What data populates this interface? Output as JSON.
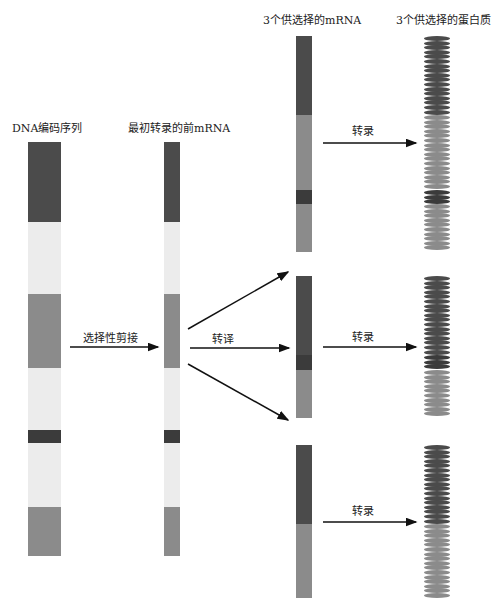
{
  "colors": {
    "dark": "#4b4b4b",
    "darker": "#3b3b3b",
    "light": "#ececec",
    "mid": "#8b8b8b",
    "arrow": "#111111"
  },
  "columns": {
    "dna": {
      "title": "DNA编码序列"
    },
    "pre_mrna": {
      "title": "最初转录的前mRNA"
    },
    "mrna": {
      "title": "3个供选择的mRNA"
    },
    "proteins": {
      "title": "3个供选择的蛋白质"
    }
  },
  "arrows": {
    "splicing_label": "选择性剪接",
    "translation_label": "转译",
    "transcription_labels": [
      "转录",
      "转录",
      "转录"
    ]
  },
  "dna_segments": [
    {
      "type": "dark",
      "top": 142,
      "bottom": 222
    },
    {
      "type": "light",
      "top": 222,
      "bottom": 294
    },
    {
      "type": "mid",
      "top": 294,
      "bottom": 368
    },
    {
      "type": "light",
      "top": 368,
      "bottom": 430
    },
    {
      "type": "darker",
      "top": 430,
      "bottom": 443
    },
    {
      "type": "light",
      "top": 443,
      "bottom": 507
    },
    {
      "type": "mid",
      "top": 507,
      "bottom": 556
    }
  ],
  "mrna_variants": [
    {
      "segments": [
        {
          "type": "dark",
          "top": 36,
          "bottom": 115
        },
        {
          "type": "mid",
          "top": 115,
          "bottom": 190
        },
        {
          "type": "darker",
          "top": 190,
          "bottom": 204
        },
        {
          "type": "mid",
          "top": 204,
          "bottom": 252
        }
      ]
    },
    {
      "segments": [
        {
          "type": "dark",
          "top": 276,
          "bottom": 355
        },
        {
          "type": "darker",
          "top": 355,
          "bottom": 370
        },
        {
          "type": "mid",
          "top": 370,
          "bottom": 418
        }
      ]
    },
    {
      "segments": [
        {
          "type": "dark",
          "top": 445,
          "bottom": 524
        },
        {
          "type": "mid",
          "top": 524,
          "bottom": 598
        }
      ]
    }
  ]
}
